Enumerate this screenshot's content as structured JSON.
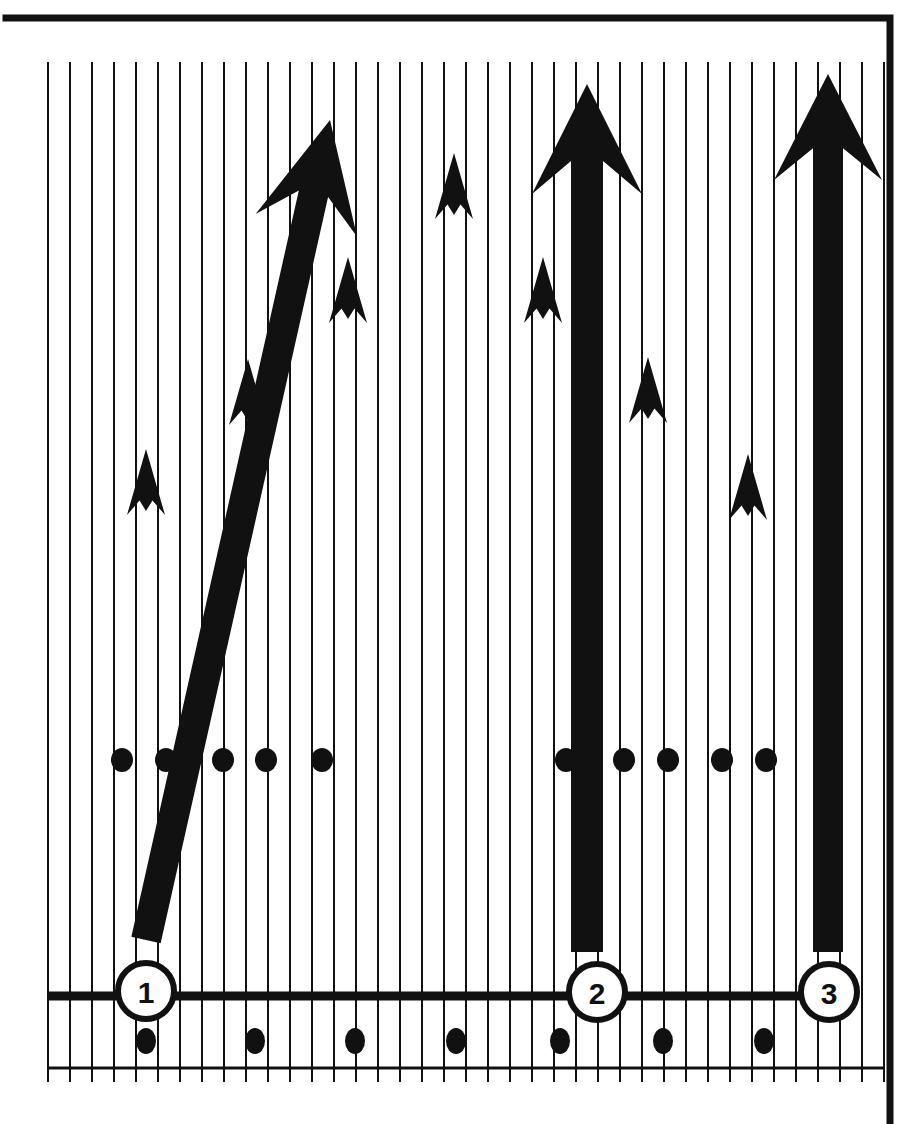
{
  "figure": {
    "background_color": "#ffffff",
    "ink_color": "#111111",
    "frame": {
      "name": "outer-frame",
      "left": 6,
      "top": 18,
      "right": 890,
      "bottom": 1124,
      "stroke_width": 7
    },
    "grid": {
      "name": "vertical-hatch-grid",
      "line_color": "#111111",
      "line_width": 2,
      "spacing": 22,
      "first_x": 48,
      "count": 39,
      "top": 62,
      "bottom": 1068
    },
    "baseline": {
      "name": "baseline-axis",
      "y": 1068,
      "x_start": 48,
      "x_end": 884,
      "stroke_width": 3,
      "tick_overhang": 14
    }
  },
  "chart_data": {
    "type": "bar",
    "xlabel": "",
    "ylabel": "",
    "grid": true,
    "legend": false,
    "categories": [
      "1",
      "2",
      "3"
    ],
    "values": [
      100,
      100,
      100
    ],
    "series": [
      {
        "name": "growth-arrows",
        "values": [
          100,
          100,
          100
        ]
      }
    ],
    "annotations": [
      "arrow-1 rises diagonally from lower-left to upper-right",
      "arrow-2 rises vertically",
      "arrow-3 rises vertically"
    ]
  },
  "markers": {
    "stage_circles": [
      {
        "id": "stage-marker-1",
        "label": "1",
        "cx": 146,
        "cy": 991,
        "r": 28,
        "stroke_width": 6
      },
      {
        "id": "stage-marker-2",
        "label": "2",
        "cx": 597,
        "cy": 992,
        "r": 28,
        "stroke_width": 6
      },
      {
        "id": "stage-marker-3",
        "label": "3",
        "cx": 829,
        "cy": 992,
        "r": 28,
        "stroke_width": 6
      }
    ],
    "stage_rule_segments": [
      {
        "id": "rule-segment-left",
        "x1": 48,
        "x2": 120,
        "y": 996,
        "stroke_width": 9
      },
      {
        "id": "rule-segment-middle",
        "x1": 174,
        "x2": 570,
        "y": 996,
        "stroke_width": 9
      },
      {
        "id": "rule-segment-right",
        "x1": 625,
        "x2": 802,
        "y": 996,
        "stroke_width": 9
      }
    ]
  },
  "arrows": {
    "major": [
      {
        "id": "major-arrow-1",
        "stage": "1",
        "orientation": "diagonal",
        "tail_x": 146,
        "tail_y": 940,
        "head_x": 330,
        "head_y": 120,
        "shaft_width": 30,
        "head_width": 104,
        "head_length": 108
      },
      {
        "id": "major-arrow-2",
        "stage": "2",
        "orientation": "vertical",
        "tail_x": 587,
        "tail_y": 952,
        "head_x": 587,
        "head_y": 84,
        "shaft_width": 32,
        "head_width": 110,
        "head_length": 110
      },
      {
        "id": "major-arrow-3",
        "stage": "3",
        "orientation": "vertical",
        "tail_x": 828,
        "tail_y": 952,
        "head_x": 828,
        "head_y": 74,
        "shaft_width": 30,
        "head_width": 108,
        "head_length": 106
      }
    ],
    "minor": [
      {
        "id": "minor-arrow-a",
        "cx": 146,
        "cy": 482,
        "width": 38,
        "height": 66
      },
      {
        "id": "minor-arrow-b",
        "cx": 248,
        "cy": 392,
        "width": 38,
        "height": 66
      },
      {
        "id": "minor-arrow-c",
        "cx": 348,
        "cy": 290,
        "width": 38,
        "height": 66
      },
      {
        "id": "minor-arrow-d",
        "cx": 454,
        "cy": 186,
        "width": 38,
        "height": 66
      },
      {
        "id": "minor-arrow-e",
        "cx": 543,
        "cy": 290,
        "width": 38,
        "height": 66
      },
      {
        "id": "minor-arrow-f",
        "cx": 648,
        "cy": 390,
        "width": 38,
        "height": 66
      },
      {
        "id": "minor-arrow-g",
        "cx": 748,
        "cy": 487,
        "width": 38,
        "height": 66
      }
    ]
  },
  "dots": {
    "mid_row": {
      "id": "mid-dot-row",
      "cy": 760,
      "rx": 11,
      "ry": 12,
      "x_positions": [
        122,
        166,
        223,
        266,
        322,
        566,
        624,
        668,
        722,
        766
      ]
    },
    "bottom_row": {
      "id": "bottom-dot-row",
      "cy": 1041,
      "rx": 10,
      "ry": 13,
      "x_positions": [
        146,
        255,
        355,
        456,
        560,
        663,
        764
      ]
    }
  }
}
